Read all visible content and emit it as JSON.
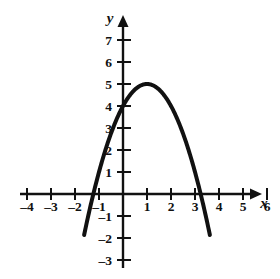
{
  "figure": {
    "background_color": "#ffffff",
    "ink_color": "#111111"
  },
  "chart_data": {
    "type": "line",
    "title": "",
    "subtitle": "",
    "xlabel": "x",
    "ylabel": "y",
    "grid": false,
    "legend": null,
    "xlim": [
      -4.8,
      6.8
    ],
    "ylim": [
      -3.6,
      7.9
    ],
    "x_ticks": [
      -4,
      -3,
      -2,
      -1,
      1,
      2,
      3,
      4,
      5,
      6
    ],
    "x_tick_labels": [
      "–4",
      "–3",
      "–2",
      "–1",
      "1",
      "2",
      "3",
      "4",
      "5",
      "6"
    ],
    "y_ticks": [
      -3,
      -2,
      -1,
      1,
      2,
      3,
      4,
      5,
      6,
      7
    ],
    "y_tick_labels": [
      "–3",
      "–2",
      "–1",
      "1",
      "2",
      "3",
      "4",
      "5",
      "6",
      "7"
    ],
    "x_axis_arrow": "right",
    "y_axis_arrow": "up",
    "series": [
      {
        "name": "parabola",
        "equation": "y = -(x - 1)^2 + 5",
        "vertex": [
          1,
          5
        ],
        "y_intercept": [
          0,
          4
        ],
        "x_intercepts": [
          -1.236,
          3.236
        ],
        "opens": "down",
        "x": [
          -1.6,
          -1.4,
          -1.2,
          -1.0,
          -0.8,
          -0.6,
          -0.4,
          -0.2,
          0.0,
          0.2,
          0.4,
          0.6,
          0.8,
          1.0,
          1.2,
          1.4,
          1.6,
          1.8,
          2.0,
          2.2,
          2.4,
          2.6,
          2.8,
          3.0,
          3.2,
          3.4,
          3.6
        ],
        "y": [
          -1.76,
          -0.76,
          0.16,
          1.0,
          1.76,
          2.44,
          3.04,
          3.56,
          4.0,
          4.36,
          4.64,
          4.84,
          4.96,
          5.0,
          4.96,
          4.84,
          4.64,
          4.36,
          4.0,
          3.56,
          3.04,
          2.44,
          1.76,
          1.0,
          0.16,
          -0.76,
          -1.76
        ],
        "x_domain_drawn": [
          -1.62,
          3.62
        ],
        "y_range_drawn": [
          -2.85,
          5.0
        ]
      }
    ]
  }
}
